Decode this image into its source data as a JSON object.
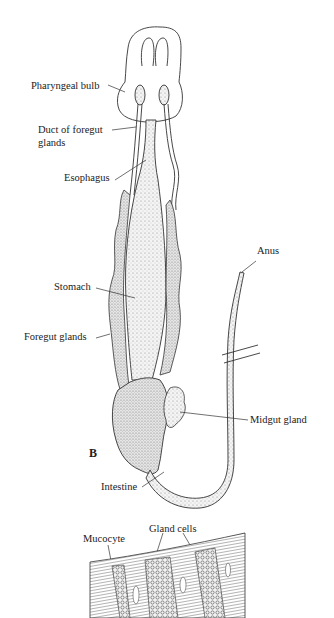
{
  "figure": {
    "panel_letter": "B",
    "labels": {
      "pharyngeal_bulb": "Pharyngeal bulb",
      "duct_line1": "Duct of foregut",
      "duct_line2": "glands",
      "esophagus": "Esophagus",
      "stomach": "Stomach",
      "foregut_glands": "Foregut glands",
      "anus": "Anus",
      "midgut_gland": "Midgut gland",
      "intestine": "Intestine",
      "mucocyte": "Mucocyte",
      "gland_cells": "Gland cells"
    }
  },
  "colors": {
    "ink": "#222222",
    "stipple": "#bdbdbd",
    "background": "#ffffff"
  }
}
